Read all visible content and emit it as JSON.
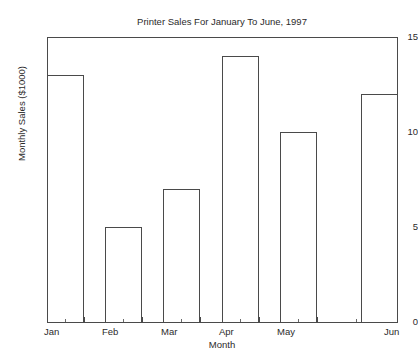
{
  "chart_data": {
    "type": "bar",
    "title": "Printer Sales For January To June, 1997",
    "xlabel": "Month",
    "ylabel": "Monthly Sales ($1000)",
    "categories": [
      "Jan",
      "Feb",
      "Mar",
      "Apr",
      "May",
      "Jun"
    ],
    "values": [
      13,
      5,
      7,
      14,
      10,
      12
    ],
    "ylim": [
      0,
      15
    ],
    "yticks": [
      0,
      5,
      10,
      15
    ],
    "ytick_labels": [
      "0",
      "5",
      "10",
      "15"
    ],
    "xtick_labels": [
      "Jan",
      "Feb",
      "Mar",
      "Apr",
      "May",
      "Jun"
    ],
    "grid": false,
    "legend": false,
    "bar_fill_color": "#ffffff",
    "bar_edge_color": "#4a4a4a",
    "axis_color": "#4a4a4a",
    "background_color": "#ffffff",
    "text_color": "#2b2b2b"
  }
}
